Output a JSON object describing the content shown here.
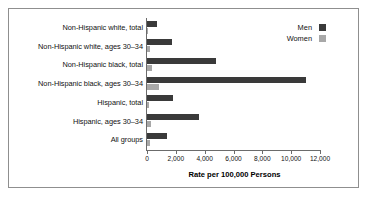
{
  "chart_data": {
    "type": "bar",
    "orientation": "horizontal",
    "title": "",
    "xlabel": "Rate per 100,000 Persons",
    "ylabel": "",
    "xlim": [
      0,
      12000
    ],
    "xticks": [
      0,
      2000,
      4000,
      6000,
      8000,
      10000,
      12000
    ],
    "xtick_labels": [
      "0",
      "2,000",
      "4,000",
      "6,000",
      "8,000",
      "10,000",
      "12,000"
    ],
    "grid": false,
    "legend_position": "top-right",
    "categories": [
      "Non-Hispanic white, total",
      "Non-Hispanic white, ages 30–34",
      "Non-Hispanic black, total",
      "Non-Hispanic black, ages 30–34",
      "Hispanic, total",
      "Hispanic, ages 30–34",
      "All groups"
    ],
    "series": [
      {
        "name": "Men",
        "color": "#3a3a3a",
        "values": [
          700,
          1700,
          4800,
          11000,
          1800,
          3600,
          1400
        ]
      },
      {
        "name": "Women",
        "color": "#a8a8a8",
        "values": [
          100,
          200,
          350,
          800,
          150,
          300,
          180
        ]
      }
    ]
  },
  "legend": {
    "items": [
      {
        "label": "Men",
        "color": "#3a3a3a"
      },
      {
        "label": "Women",
        "color": "#a8a8a8"
      }
    ]
  },
  "axis": {
    "title": "Rate per 100,000 Persons"
  }
}
